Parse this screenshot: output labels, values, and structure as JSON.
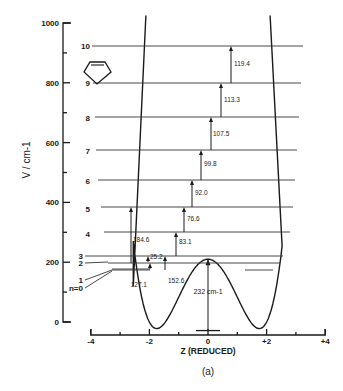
{
  "chart_data": {
    "type": "diagram",
    "title": "",
    "caption": "(a)",
    "xlabel": "Z (REDUCED)",
    "ylabel": "V / cm-1",
    "xlim": [
      -4,
      4
    ],
    "ylim": [
      0,
      1000
    ],
    "x_ticks": [
      "-4",
      "-2",
      "0",
      "+2",
      "+4"
    ],
    "y_ticks": [
      "0",
      "200",
      "400",
      "600",
      "800",
      "1000"
    ],
    "barrier_height_label": "232 cm-1",
    "barrier_height": 232,
    "potential_minima_z": [
      -1.75,
      1.75
    ],
    "energy_levels": [
      {
        "label": "n=0",
        "energy": 0
      },
      {
        "label": "1",
        "energy": 0.5
      },
      {
        "label": "2",
        "energy": 127.1
      },
      {
        "label": "3",
        "energy": 152.6
      },
      {
        "label": "4",
        "energy": 235.7
      },
      {
        "label": "5",
        "energy": 312.3
      },
      {
        "label": "6",
        "energy": 404.3
      },
      {
        "label": "7",
        "energy": 504.1
      },
      {
        "label": "8",
        "energy": 611.6
      },
      {
        "label": "9",
        "energy": 724.9
      },
      {
        "label": "10",
        "energy": 844.3
      }
    ],
    "transitions": [
      {
        "label": "127.1",
        "from": "1",
        "to": "2"
      },
      {
        "label": "152.6",
        "from": "0",
        "to": "3"
      },
      {
        "label": "25.2",
        "from": "2",
        "to": "3"
      },
      {
        "label": "184.6",
        "from": "2",
        "to": "5"
      },
      {
        "label": "83.1",
        "from": "3",
        "to": "4"
      },
      {
        "label": "76.6",
        "from": "4",
        "to": "5"
      },
      {
        "label": "92.0",
        "from": "5",
        "to": "6"
      },
      {
        "label": "99.8",
        "from": "6",
        "to": "7"
      },
      {
        "label": "107.5",
        "from": "7",
        "to": "8"
      },
      {
        "label": "113.3",
        "from": "8",
        "to": "9"
      },
      {
        "label": "119.4",
        "from": "9",
        "to": "10"
      }
    ],
    "molecule_icon": "cyclopentene-ring"
  },
  "labels": {
    "ylabel": "V / cm-1",
    "xlabel": "Z (REDUCED)",
    "caption": "(a)",
    "barrier": "232 cm-1"
  }
}
